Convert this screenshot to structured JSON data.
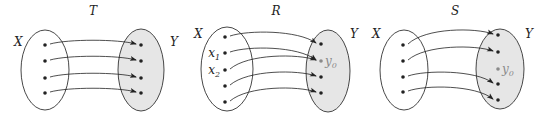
{
  "diagrams": [
    {
      "id": "T",
      "title": "T",
      "domain_label": "X",
      "codomain_label": "Y",
      "domain_points": [
        {
          "label": ""
        },
        {
          "label": ""
        },
        {
          "label": ""
        },
        {
          "label": ""
        }
      ],
      "codomain_points": [
        {
          "label": ""
        },
        {
          "label": ""
        },
        {
          "label": ""
        },
        {
          "label": ""
        }
      ],
      "mappings": [
        [
          0,
          0
        ],
        [
          1,
          1
        ],
        [
          2,
          2
        ],
        [
          3,
          3
        ]
      ],
      "property": "one-to-one and onto"
    },
    {
      "id": "R",
      "title": "R",
      "domain_label": "X",
      "codomain_label": "Y",
      "domain_points": [
        {
          "label": ""
        },
        {
          "label": "x",
          "sub": "1"
        },
        {
          "label": "x",
          "sub": "2"
        },
        {
          "label": ""
        },
        {
          "label": ""
        }
      ],
      "codomain_points": [
        {
          "label": ""
        },
        {
          "label": "y",
          "sub": "0",
          "highlight": true
        },
        {
          "label": ""
        },
        {
          "label": ""
        }
      ],
      "mappings": [
        [
          0,
          0
        ],
        [
          1,
          1
        ],
        [
          2,
          1
        ],
        [
          3,
          2
        ],
        [
          4,
          3
        ]
      ],
      "property": "onto, not one-to-one"
    },
    {
      "id": "S",
      "title": "S",
      "domain_label": "X",
      "codomain_label": "Y",
      "domain_points": [
        {
          "label": ""
        },
        {
          "label": ""
        },
        {
          "label": ""
        },
        {
          "label": ""
        }
      ],
      "codomain_points": [
        {
          "label": ""
        },
        {
          "label": ""
        },
        {
          "label": "y",
          "sub": "0",
          "highlight": true
        },
        {
          "label": ""
        },
        {
          "label": ""
        }
      ],
      "mappings": [
        [
          0,
          0
        ],
        [
          1,
          1
        ],
        [
          2,
          3
        ],
        [
          3,
          4
        ]
      ],
      "property": "one-to-one, not onto"
    }
  ],
  "colors": {
    "codomain_fill": "#e6e6e6",
    "domain_fill": "#ffffff",
    "highlight": "#8a8a8a",
    "ink": "#222222"
  }
}
